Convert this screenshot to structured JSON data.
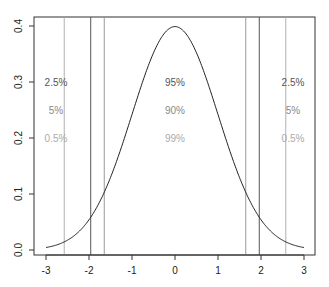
{
  "chart_data": {
    "type": "line",
    "title": "",
    "xlabel": "",
    "ylabel": "",
    "xlim": [
      -3,
      3
    ],
    "ylim": [
      0,
      0.4
    ],
    "grid": false,
    "x_ticks": [
      "-3",
      "-2",
      "-1",
      "0",
      "1",
      "2",
      "3"
    ],
    "y_ticks": [
      "0.0",
      "0.1",
      "0.2",
      "0.3",
      "0.4"
    ],
    "series": [
      {
        "name": "Standard normal density",
        "x": [
          -3,
          -2.5,
          -2,
          -1.5,
          -1,
          -0.5,
          0,
          0.5,
          1,
          1.5,
          2,
          2.5,
          3
        ],
        "values": [
          0.0044,
          0.0175,
          0.054,
          0.1295,
          0.242,
          0.352,
          0.399,
          0.352,
          0.242,
          0.1295,
          0.054,
          0.0175,
          0.0044
        ]
      }
    ],
    "vertical_lines": [
      {
        "x": -2.576,
        "color": "#b0b0b0",
        "level": "99%"
      },
      {
        "x": -1.96,
        "color": "#555555",
        "level": "95%"
      },
      {
        "x": -1.645,
        "color": "#999999",
        "level": "90%"
      },
      {
        "x": 1.645,
        "color": "#999999",
        "level": "90%"
      },
      {
        "x": 1.96,
        "color": "#555555",
        "level": "95%"
      },
      {
        "x": 2.576,
        "color": "#b0b0b0",
        "level": "99%"
      }
    ],
    "annotations": {
      "left": [
        {
          "text": "2.5%",
          "y": 0.3,
          "color": "#555555"
        },
        {
          "text": "5%",
          "y": 0.25,
          "color": "#888888"
        },
        {
          "text": "0.5%",
          "y": 0.2,
          "color": "#aaaaaa"
        }
      ],
      "center": [
        {
          "text": "95%",
          "y": 0.3,
          "color": "#555555"
        },
        {
          "text": "90%",
          "y": 0.25,
          "color": "#888888"
        },
        {
          "text": "99%",
          "y": 0.2,
          "color": "#aaaaaa"
        }
      ],
      "right": [
        {
          "text": "2.5%",
          "y": 0.3,
          "color": "#555555"
        },
        {
          "text": "5%",
          "y": 0.25,
          "color": "#888888"
        },
        {
          "text": "0.5%",
          "y": 0.2,
          "color": "#aaaaaa"
        }
      ]
    }
  }
}
